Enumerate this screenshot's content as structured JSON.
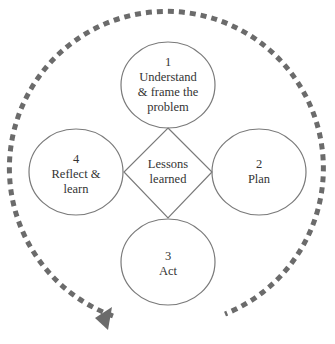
{
  "colors": {
    "stroke": "#6e6e6e",
    "dash": "#6b6b6b",
    "text": "#333333"
  },
  "center": {
    "label_line1": "Lessons",
    "label_line2": "learned"
  },
  "steps": [
    {
      "number": "1",
      "lines": [
        "Understand",
        "& frame the",
        "problem"
      ]
    },
    {
      "number": "2",
      "lines": [
        "Plan"
      ]
    },
    {
      "number": "3",
      "lines": [
        "Act"
      ]
    },
    {
      "number": "4",
      "lines": [
        "Reflect &",
        "learn"
      ]
    }
  ],
  "cycle": {
    "direction": "clockwise",
    "arrow_icon": "triangle-arrowhead"
  }
}
